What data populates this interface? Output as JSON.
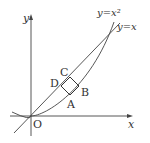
{
  "diagram": {
    "axes": {
      "x_label": "x",
      "y_label": "y",
      "origin_label": "O"
    },
    "curves": {
      "parabola_label": "y=x²",
      "line_label": "y=x"
    },
    "points": {
      "A": "A",
      "B": "B",
      "C": "C",
      "D": "D"
    },
    "colors": {
      "stroke": "#333333",
      "background": "#ffffff"
    }
  }
}
